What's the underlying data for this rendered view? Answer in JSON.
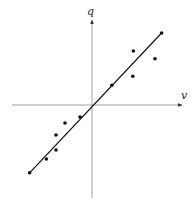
{
  "chart_data": {
    "type": "scatter",
    "title": "",
    "xlabel": "v",
    "ylabel": "q",
    "grid": false,
    "legend": null,
    "axes": "centered at origin with arrows",
    "xlim": [
      -10,
      10
    ],
    "ylim": [
      -10,
      10
    ],
    "points": [
      {
        "x": -2.0,
        "y": -2.0
      },
      {
        "x": -4.5,
        "y": -3.0
      },
      {
        "x": -6.0,
        "y": -5.0
      },
      {
        "x": -6.0,
        "y": -7.5
      },
      {
        "x": -7.6,
        "y": -9.0
      },
      {
        "x": 3.3,
        "y": 3.3
      },
      {
        "x": 6.8,
        "y": 4.8
      },
      {
        "x": 6.9,
        "y": 9.0
      },
      {
        "x": 10.5,
        "y": 7.7
      }
    ],
    "fit_line": {
      "slope": 1.1,
      "intercept": 0.0,
      "x_from": -10.4,
      "x_to": 11.6
    },
    "line_endpoints": [
      {
        "x": -10.4,
        "y": -11.3
      },
      {
        "x": 11.6,
        "y": 12.0
      }
    ]
  },
  "labels": {
    "x_axis": "v",
    "y_axis": "q"
  }
}
